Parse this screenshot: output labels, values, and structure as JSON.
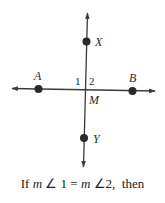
{
  "diagram": {
    "points": {
      "A": {
        "label": "A"
      },
      "B": {
        "label": "B"
      },
      "X": {
        "label": "X"
      },
      "Y": {
        "label": "Y"
      },
      "M": {
        "label": "M"
      }
    },
    "angles": {
      "angle1": "1",
      "angle2": "2"
    },
    "colors": {
      "line": "#3a3a3a",
      "point": "#2a2a2a"
    }
  },
  "caption": {
    "prefix": "If ",
    "m1": "m",
    "angle_sym1": " ∠ ",
    "num1": "1 = ",
    "m2": "m",
    "angle_sym2": " ∠",
    "num2": "2,",
    "suffix": "  then"
  }
}
